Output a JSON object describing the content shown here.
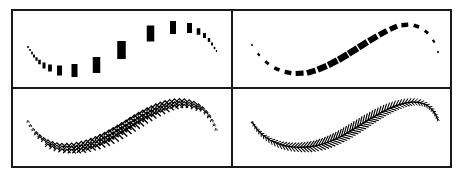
{
  "figure": {
    "title": "",
    "colors": {
      "ink": "#000000",
      "border": "#1a1a1a",
      "background": "#ffffff"
    },
    "grid": {
      "left": 12,
      "top": 10,
      "right": 451,
      "bottom": 167,
      "col_split": 232,
      "row_split": 88,
      "border_width": 2
    },
    "panels": [
      {
        "id": "top-left",
        "description": "Upright rectangle stamps along an S-curve, scaled by position",
        "stamp": "rectangle",
        "rotate_along_path": false,
        "stamps": [
          {
            "x": 28,
            "y": 47,
            "w": 1.5,
            "h": 2
          },
          {
            "x": 30,
            "y": 50,
            "w": 1.5,
            "h": 2
          },
          {
            "x": 32,
            "y": 53,
            "w": 1.8,
            "h": 2.5
          },
          {
            "x": 34,
            "y": 56,
            "w": 2,
            "h": 3
          },
          {
            "x": 36.5,
            "y": 59,
            "w": 2.2,
            "h": 3.5
          },
          {
            "x": 39.5,
            "y": 62,
            "w": 2.6,
            "h": 4.5
          },
          {
            "x": 44,
            "y": 65.5,
            "w": 3,
            "h": 6
          },
          {
            "x": 50,
            "y": 68,
            "w": 3.8,
            "h": 7
          },
          {
            "x": 59.5,
            "y": 70.5,
            "w": 5,
            "h": 10
          },
          {
            "x": 74.5,
            "y": 70.5,
            "w": 6,
            "h": 13
          },
          {
            "x": 96.5,
            "y": 65,
            "w": 7.5,
            "h": 16
          },
          {
            "x": 121.5,
            "y": 50,
            "w": 8.5,
            "h": 18
          },
          {
            "x": 150.5,
            "y": 33.5,
            "w": 7.5,
            "h": 16
          },
          {
            "x": 173,
            "y": 27.5,
            "w": 6,
            "h": 13
          },
          {
            "x": 189.5,
            "y": 28,
            "w": 5,
            "h": 10
          },
          {
            "x": 198.5,
            "y": 31.5,
            "w": 3.6,
            "h": 6.5
          },
          {
            "x": 204.5,
            "y": 35.5,
            "w": 3,
            "h": 5
          },
          {
            "x": 209,
            "y": 40,
            "w": 2.4,
            "h": 4
          },
          {
            "x": 212,
            "y": 44,
            "w": 2,
            "h": 3
          },
          {
            "x": 214.5,
            "y": 48,
            "w": 1.6,
            "h": 2.4
          },
          {
            "x": 216.5,
            "y": 51,
            "w": 1.3,
            "h": 2
          }
        ]
      },
      {
        "id": "top-right",
        "description": "Rectangle dashes rotated along the tangent of an S-curve",
        "stamp": "rectangle",
        "rotate_along_path": true,
        "path": "M 252 45 C 268 72, 290 76, 310 72 C 340 64, 365 40, 395 27 C 415 20, 432 30, 438 52",
        "stamps_count": 20
      },
      {
        "id": "bottom-left",
        "description": "Upright chevron (fern-leaf) stamps along an S-curve",
        "stamp": "chevron-stack",
        "rotate_along_path": false,
        "path": "M 28 122 C 40 145, 60 152, 85 146 C 115 138, 135 118, 160 108 C 185 98, 205 102, 216 130",
        "stamps_count": 46
      },
      {
        "id": "bottom-right",
        "description": "Chevron stamps rotated along the tangent, forming a herringbone fern stroke",
        "stamp": "chevron",
        "rotate_along_path": true,
        "path": "M 252 122 C 265 145, 290 150, 315 146 C 345 140, 365 118, 395 106 C 420 97, 432 104, 438 120",
        "stamps_count": 70
      }
    ]
  }
}
